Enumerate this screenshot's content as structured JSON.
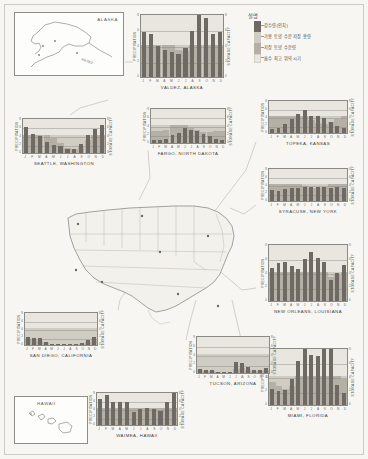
{
  "figure": {
    "axis_labels": {
      "left": "PRECIPITATION",
      "right": "STORAGE CAPACITY"
    },
    "months": [
      "J",
      "F",
      "M",
      "A",
      "M",
      "J",
      "J",
      "A",
      "S",
      "O",
      "N",
      "D"
    ],
    "left_ticks": [
      "8",
      "6",
      "4",
      "2",
      "0"
    ],
    "right_ticks": [
      "8",
      "6",
      "4",
      "2",
      "0"
    ]
  },
  "legend": {
    "title": "설명",
    "items": [
      {
        "key": "precipitation",
        "label": "강수량(인치)",
        "color": "#6e6a63"
      },
      {
        "key": "available_storage",
        "label": "가용 토양 수분 저장 용량",
        "color": "#cfccc4"
      },
      {
        "key": "stored_moisture",
        "label": "저장 토양 수분량",
        "color": "#b4b0a6"
      },
      {
        "key": "peak_absorption",
        "label": "흡수 최고 위약 시기",
        "color": "#e8e6df"
      }
    ]
  },
  "insets": [
    {
      "name": "alaska",
      "label": "ALASKA"
    },
    {
      "name": "hawaii",
      "label": "HAWAII"
    }
  ],
  "chart_data": [
    {
      "type": "bar",
      "id": "valdez",
      "title": "VALDEZ, ALASKA",
      "xlabel": "",
      "ylabel": "PRECIPITATION",
      "y2label": "STORAGE CAPACITY",
      "categories": [
        "J",
        "F",
        "M",
        "A",
        "M",
        "J",
        "J",
        "A",
        "S",
        "O",
        "N",
        "D"
      ],
      "ylim": [
        0,
        8
      ],
      "grid": true,
      "series": [
        {
          "name": "precipitation",
          "values": [
            5.6,
            5.4,
            3.9,
            3.4,
            3.1,
            2.9,
            3.6,
            5.8,
            8.0,
            7.4,
            5.4,
            5.6
          ]
        },
        {
          "name": "stored_moisture",
          "values": [
            4.0,
            4.0,
            4.0,
            4.0,
            4.0,
            3.4,
            3.2,
            4.0,
            4.0,
            4.0,
            4.0,
            4.0
          ]
        },
        {
          "name": "available_storage",
          "values": [
            4.0,
            4.0,
            4.0,
            4.0,
            4.0,
            4.0,
            4.0,
            4.0,
            4.0,
            4.0,
            4.0,
            4.0
          ]
        }
      ]
    },
    {
      "type": "bar",
      "id": "seattle",
      "title": "SEATTLE, WASHINGTON",
      "ylabel": "PRECIPITATION",
      "y2label": "STORAGE CAPACITY",
      "categories": [
        "J",
        "F",
        "M",
        "A",
        "M",
        "J",
        "J",
        "A",
        "S",
        "O",
        "N",
        "D"
      ],
      "ylim": [
        0,
        8
      ],
      "grid": true,
      "series": [
        {
          "name": "precipitation",
          "values": [
            5.8,
            4.2,
            3.7,
            2.4,
            1.7,
            1.5,
            0.8,
            1.0,
            2.0,
            4.0,
            5.4,
            6.3
          ]
        },
        {
          "name": "stored_moisture",
          "values": [
            4.0,
            4.0,
            4.0,
            4.0,
            3.3,
            2.2,
            1.1,
            0.9,
            1.6,
            3.0,
            4.0,
            4.0
          ]
        },
        {
          "name": "available_storage",
          "values": [
            4.0,
            4.0,
            4.0,
            4.0,
            4.0,
            4.0,
            4.0,
            4.0,
            4.0,
            4.0,
            4.0,
            4.0
          ]
        }
      ]
    },
    {
      "type": "bar",
      "id": "fargo",
      "title": "FARGO, NORTH DAKOTA",
      "ylabel": "PRECIPITATION",
      "y2label": "STORAGE CAPACITY",
      "categories": [
        "J",
        "F",
        "M",
        "A",
        "M",
        "J",
        "J",
        "A",
        "S",
        "O",
        "N",
        "D"
      ],
      "ylim": [
        0,
        8
      ],
      "grid": true,
      "series": [
        {
          "name": "precipitation",
          "values": [
            0.7,
            0.6,
            1.0,
            1.8,
            2.3,
            3.4,
            2.9,
            2.6,
            2.0,
            1.5,
            0.9,
            0.7
          ]
        },
        {
          "name": "stored_moisture",
          "values": [
            2.6,
            2.6,
            3.0,
            4.0,
            4.0,
            4.0,
            3.4,
            2.8,
            2.4,
            2.4,
            2.6,
            2.6
          ]
        },
        {
          "name": "available_storage",
          "values": [
            4.0,
            4.0,
            4.0,
            4.0,
            4.0,
            4.0,
            4.0,
            4.0,
            4.0,
            4.0,
            4.0,
            4.0
          ]
        }
      ]
    },
    {
      "type": "bar",
      "id": "topeka",
      "title": "TOPEKA, KANSAS",
      "ylabel": "PRECIPITATION",
      "y2label": "STORAGE CAPACITY",
      "categories": [
        "J",
        "F",
        "M",
        "A",
        "M",
        "J",
        "J",
        "A",
        "S",
        "O",
        "N",
        "D"
      ],
      "ylim": [
        0,
        8
      ],
      "grid": true,
      "series": [
        {
          "name": "precipitation",
          "values": [
            0.9,
            1.1,
            2.2,
            3.2,
            4.4,
            5.3,
            4.0,
            4.1,
            3.6,
            2.6,
            1.6,
            1.1
          ]
        },
        {
          "name": "stored_moisture",
          "values": [
            4.0,
            4.0,
            4.0,
            4.0,
            4.0,
            4.0,
            3.1,
            2.4,
            2.2,
            2.6,
            3.4,
            4.0
          ]
        },
        {
          "name": "available_storage",
          "values": [
            4.0,
            4.0,
            4.0,
            4.0,
            4.0,
            4.0,
            4.0,
            4.0,
            4.0,
            4.0,
            4.0,
            4.0
          ]
        }
      ]
    },
    {
      "type": "bar",
      "id": "syracuse",
      "title": "SYRACUSE, NEW YORK",
      "ylabel": "PRECIPITATION",
      "y2label": "STORAGE CAPACITY",
      "categories": [
        "J",
        "F",
        "M",
        "A",
        "M",
        "J",
        "J",
        "A",
        "S",
        "O",
        "N",
        "D"
      ],
      "ylim": [
        0,
        8
      ],
      "grid": true,
      "series": [
        {
          "name": "precipitation",
          "values": [
            2.5,
            2.3,
            2.8,
            3.0,
            3.1,
            3.3,
            3.4,
            3.3,
            3.4,
            3.1,
            3.3,
            3.0
          ]
        },
        {
          "name": "stored_moisture",
          "values": [
            4.0,
            4.0,
            4.0,
            4.0,
            4.0,
            3.6,
            3.0,
            3.0,
            3.4,
            4.0,
            4.0,
            4.0
          ]
        },
        {
          "name": "available_storage",
          "values": [
            4.0,
            4.0,
            4.0,
            4.0,
            4.0,
            4.0,
            4.0,
            4.0,
            4.0,
            4.0,
            4.0,
            4.0
          ]
        }
      ]
    },
    {
      "type": "bar",
      "id": "neworleans",
      "title": "NEW ORLEANS, LOUISIANA",
      "ylabel": "PRECIPITATION",
      "y2label": "STORAGE CAPACITY",
      "categories": [
        "J",
        "F",
        "M",
        "A",
        "M",
        "J",
        "J",
        "A",
        "S",
        "O",
        "N",
        "D"
      ],
      "ylim": [
        0,
        8
      ],
      "grid": true,
      "series": [
        {
          "name": "precipitation",
          "values": [
            4.5,
            5.2,
            5.4,
            4.8,
            4.4,
            5.8,
            6.7,
            6.0,
            5.4,
            2.9,
            3.8,
            5.0
          ]
        },
        {
          "name": "stored_moisture",
          "values": [
            4.0,
            4.0,
            4.0,
            4.0,
            4.0,
            4.0,
            4.0,
            4.0,
            4.0,
            3.3,
            3.6,
            4.0
          ]
        },
        {
          "name": "available_storage",
          "values": [
            4.0,
            4.0,
            4.0,
            4.0,
            4.0,
            4.0,
            4.0,
            4.0,
            4.0,
            4.0,
            4.0,
            4.0
          ]
        }
      ]
    },
    {
      "type": "bar",
      "id": "miami",
      "title": "MIAMI, FLORIDA",
      "ylabel": "PRECIPITATION",
      "y2label": "STORAGE CAPACITY",
      "categories": [
        "J",
        "F",
        "M",
        "A",
        "M",
        "J",
        "J",
        "A",
        "S",
        "O",
        "N",
        "D"
      ],
      "ylim": [
        0,
        8
      ],
      "grid": true,
      "series": [
        {
          "name": "precipitation",
          "values": [
            2.2,
            2.0,
            2.1,
            3.6,
            6.1,
            9.0,
            6.9,
            6.8,
            8.7,
            8.2,
            2.7,
            1.6
          ]
        },
        {
          "name": "stored_moisture",
          "values": [
            3.2,
            2.6,
            2.2,
            2.6,
            4.0,
            4.0,
            4.0,
            4.0,
            4.0,
            4.0,
            4.0,
            3.6
          ]
        },
        {
          "name": "available_storage",
          "values": [
            4.0,
            4.0,
            4.0,
            4.0,
            4.0,
            4.0,
            4.0,
            4.0,
            4.0,
            4.0,
            4.0,
            4.0
          ]
        }
      ]
    },
    {
      "type": "bar",
      "id": "tucson",
      "title": "TUCSON, ARIZONA",
      "ylabel": "PRECIPITATION",
      "y2label": "STORAGE CAPACITY",
      "categories": [
        "J",
        "F",
        "M",
        "A",
        "M",
        "J",
        "J",
        "A",
        "S",
        "O",
        "N",
        "D"
      ],
      "ylim": [
        0,
        8
      ],
      "grid": true,
      "series": [
        {
          "name": "precipitation",
          "values": [
            0.8,
            0.7,
            0.7,
            0.3,
            0.2,
            0.2,
            2.4,
            2.2,
            1.2,
            0.6,
            0.6,
            1.0
          ]
        },
        {
          "name": "stored_moisture",
          "values": [
            0.6,
            0.5,
            0.4,
            0.2,
            0.1,
            0.1,
            0.9,
            1.1,
            0.7,
            0.4,
            0.4,
            0.6
          ]
        },
        {
          "name": "available_storage",
          "values": [
            4.0,
            4.0,
            4.0,
            4.0,
            4.0,
            4.0,
            4.0,
            4.0,
            4.0,
            4.0,
            4.0,
            4.0
          ]
        }
      ]
    },
    {
      "type": "bar",
      "id": "sandiego",
      "title": "SAN DIEGO, CALIFORNIA",
      "ylabel": "PRECIPITATION",
      "y2label": "STORAGE CAPACITY",
      "categories": [
        "J",
        "F",
        "M",
        "A",
        "M",
        "J",
        "J",
        "A",
        "S",
        "O",
        "N",
        "D"
      ],
      "ylim": [
        0,
        8
      ],
      "grid": true,
      "series": [
        {
          "name": "precipitation",
          "values": [
            2.0,
            1.6,
            1.6,
            0.8,
            0.2,
            0.1,
            0.0,
            0.1,
            0.2,
            0.4,
            1.1,
            1.9
          ]
        },
        {
          "name": "stored_moisture",
          "values": [
            1.4,
            1.1,
            0.9,
            0.4,
            0.1,
            0.0,
            0.0,
            0.0,
            0.1,
            0.2,
            0.6,
            1.3
          ]
        },
        {
          "name": "available_storage",
          "values": [
            4.0,
            4.0,
            4.0,
            4.0,
            4.0,
            4.0,
            4.0,
            4.0,
            4.0,
            4.0,
            4.0,
            4.0
          ]
        }
      ]
    },
    {
      "type": "bar",
      "id": "waimea",
      "title": "WAIMEA, HAWAII",
      "ylabel": "PRECIPITATION",
      "y2label": "STORAGE CAPACITY",
      "categories": [
        "J",
        "F",
        "M",
        "A",
        "M",
        "J",
        "J",
        "A",
        "S",
        "O",
        "N",
        "D"
      ],
      "ylim": [
        0,
        8
      ],
      "grid": true,
      "series": [
        {
          "name": "precipitation",
          "values": [
            6.2,
            7.1,
            5.4,
            5.3,
            5.3,
            3.1,
            3.8,
            4.1,
            3.7,
            3.3,
            5.5,
            7.6
          ]
        },
        {
          "name": "stored_moisture",
          "values": [
            4.0,
            4.0,
            4.0,
            4.0,
            4.0,
            4.0,
            4.0,
            4.0,
            4.0,
            4.0,
            4.0,
            4.0
          ]
        },
        {
          "name": "available_storage",
          "values": [
            4.0,
            4.0,
            4.0,
            4.0,
            4.0,
            4.0,
            4.0,
            4.0,
            4.0,
            4.0,
            4.0,
            4.0
          ]
        }
      ]
    }
  ]
}
